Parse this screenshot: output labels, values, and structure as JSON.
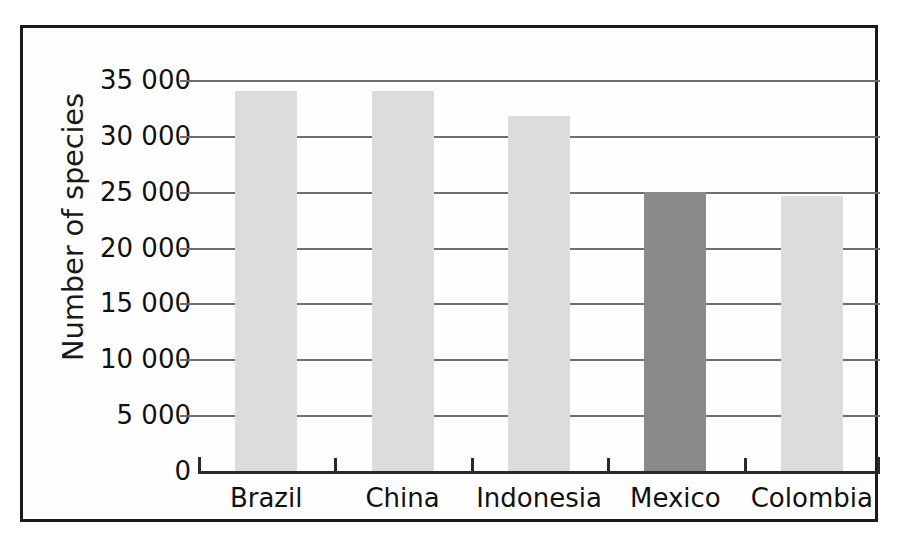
{
  "chart_data": {
    "type": "bar",
    "title": "",
    "xlabel": "",
    "ylabel": "Number of species",
    "categories": [
      "Brazil",
      "China",
      "Indonesia",
      "Mexico",
      "Colombia"
    ],
    "values": [
      34000,
      34000,
      31800,
      25000,
      24600
    ],
    "highlighted_category": "Mexico",
    "ylim": [
      0,
      36000
    ],
    "yticks": [
      0,
      5000,
      10000,
      15000,
      20000,
      25000,
      30000,
      35000
    ],
    "ytick_labels": [
      "0",
      "5 000",
      "10 000",
      "15 000",
      "20 000",
      "25 000",
      "30 000",
      "35 000"
    ],
    "grid": true,
    "legend": "none",
    "bar_color": "#dcdcdc",
    "highlight_color": "#8a8a8a",
    "axis_color": "#2a2a2a",
    "gridline_color": "#6e6e6e",
    "frame_color": "#1b1b1b",
    "background": "#ffffff"
  }
}
